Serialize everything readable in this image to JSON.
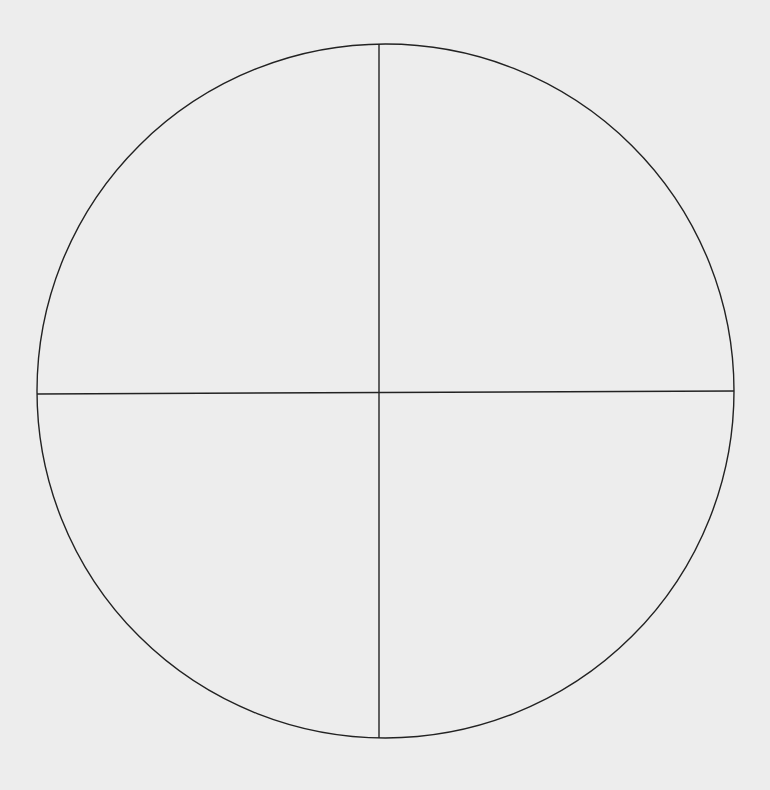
{
  "canvas": {
    "width": 770,
    "height": 790,
    "background": "#ededed",
    "stroke_color": "#222222",
    "stroke_width": 1.4
  },
  "circle": {
    "cx": 385.5,
    "cy": 391,
    "rx": 348.5,
    "ry": 347
  },
  "vertical_line": {
    "x1": 379,
    "y1": 44,
    "x2": 379,
    "y2": 738
  },
  "horizontal_line": {
    "x1": 37,
    "y1": 394,
    "x2": 734,
    "y2": 391
  },
  "quadrants": [
    "top-left",
    "top-right",
    "bottom-left",
    "bottom-right"
  ]
}
